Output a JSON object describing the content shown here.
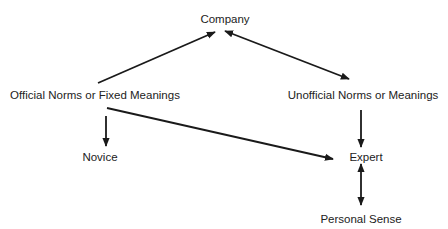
{
  "diagram": {
    "nodes": {
      "company": {
        "label": "Company"
      },
      "official": {
        "label": "Official Norms or Fixed Meanings"
      },
      "unofficial": {
        "label": "Unofficial Norms or Meanings"
      },
      "novice": {
        "label": "Novice"
      },
      "expert": {
        "label": "Expert"
      },
      "personal_sense": {
        "label": "Personal Sense"
      }
    },
    "edges": [
      {
        "from": "Official Norms or Fixed Meanings",
        "to": "Company",
        "direction": "forward"
      },
      {
        "from": "Company",
        "to": "Unofficial Norms or Meanings",
        "direction": "both"
      },
      {
        "from": "Official Norms or Fixed Meanings",
        "to": "Novice",
        "direction": "forward"
      },
      {
        "from": "Official Norms or Fixed Meanings",
        "to": "Expert",
        "direction": "forward"
      },
      {
        "from": "Unofficial Norms or Meanings",
        "to": "Expert",
        "direction": "forward"
      },
      {
        "from": "Expert",
        "to": "Personal Sense",
        "direction": "both"
      }
    ],
    "colors": {
      "line": "#1a1a1a",
      "text": "#222222",
      "background": "#ffffff"
    }
  }
}
